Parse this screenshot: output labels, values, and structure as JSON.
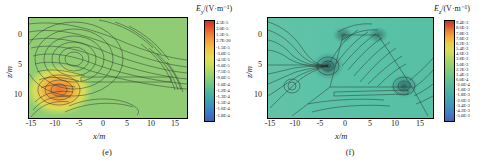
{
  "figure": {
    "panels": [
      {
        "id": "e",
        "caption": "(e)",
        "xlabel": "x/m",
        "ylabel": "z/m",
        "xticks": [
          "-15",
          "-10",
          "-5",
          "0",
          "5",
          "10",
          "15"
        ],
        "yticks": [
          "0",
          "5",
          "10"
        ],
        "colorbar": {
          "title_symbol": "E",
          "title_sub": "y",
          "title_unit": "/(V·m⁻¹)",
          "ticks": [
            "4.5E-5",
            "3.0E-5",
            "1.5E-5",
            "2.7E-20",
            "-1.5E-5",
            "-3.0E-5",
            "-4.5E-5",
            "-6.0E-5",
            "-7.5E-5",
            "-9.0E-5",
            "-1.0E-4",
            "-1.2E-4",
            "-1.3E-4",
            "-1.5E-4",
            "-1.6E-4",
            "-1.8E-4"
          ]
        }
      },
      {
        "id": "f",
        "caption": "(f)",
        "xlabel": "x/m",
        "ylabel": "z/m",
        "xticks": [
          "-15",
          "-10",
          "-5",
          "0",
          "5",
          "10",
          "15"
        ],
        "yticks": [
          "0",
          "5",
          "10"
        ],
        "colorbar": {
          "title_symbol": "E",
          "title_sub": "z",
          "title_unit": "/(V·m⁻¹)",
          "ticks": [
            "9.4E-3",
            "8.6E-3",
            "7.8E-3",
            "7.0E-3",
            "6.2E-3",
            "5.4E-3",
            "4.6E-3",
            "3.8E-3",
            "3.0E-3",
            "2.2E-3",
            "1.4E-3",
            "6.0E-4",
            "-2.0E-4",
            "-1.0E-3",
            "-1.8E-3",
            "-2.6E-3",
            "-3.4E-3",
            "-4.2E-3",
            "-5.0E-3"
          ]
        }
      }
    ]
  },
  "chart_data": [
    {
      "type": "heatmap",
      "panel": "e",
      "title": "Ey/(V·m⁻¹)",
      "xlabel": "x/m",
      "ylabel": "z/m",
      "xlim": [
        -17,
        17
      ],
      "ylim": [
        13,
        -2
      ],
      "xticks": [
        -15,
        -10,
        -5,
        0,
        5,
        10,
        15
      ],
      "yticks": [
        0,
        5,
        10
      ],
      "colormap": "jet",
      "zlim": [
        -0.00018,
        4.5e-05
      ],
      "colorbar_values": [
        4.5e-05,
        3e-05,
        1.5e-05,
        2.7e-20,
        -1.5e-05,
        -3e-05,
        -4.5e-05,
        -6e-05,
        -7.5e-05,
        -9e-05,
        -0.0001,
        -0.00012,
        -0.00013,
        -0.00015,
        -0.00016,
        -0.00018
      ],
      "grid": false,
      "features": [
        {
          "kind": "hot-spot",
          "x": -15.5,
          "z": 10.2,
          "color": "#e8743a",
          "note": "positive field maximum lower-left"
        },
        {
          "kind": "cold-spot",
          "x": -10.5,
          "z": 5.2,
          "color": "#3d78a0",
          "note": "negative field minimum"
        },
        {
          "kind": "conductor",
          "shape": "horizontal-bar",
          "x_start": -8.5,
          "x_end": 12.5,
          "z": 8.3
        }
      ]
    },
    {
      "type": "heatmap",
      "panel": "f",
      "title": "Ez/(V·m⁻¹)",
      "xlabel": "x/m",
      "ylabel": "z/m",
      "xlim": [
        -17,
        16
      ],
      "ylim": [
        13,
        -2
      ],
      "xticks": [
        -15,
        -10,
        -5,
        0,
        5,
        10,
        15
      ],
      "yticks": [
        0,
        5,
        10
      ],
      "colormap": "jet",
      "zlim": [
        -0.005,
        0.0094
      ],
      "colorbar_values": [
        0.0094,
        0.0086,
        0.0078,
        0.007,
        0.0062,
        0.0054,
        0.0046,
        0.0038,
        0.003,
        0.0022,
        0.0014,
        0.0006,
        -0.0002,
        -0.001,
        -0.0018,
        -0.0026,
        -0.0034,
        -0.0042,
        -0.005
      ],
      "grid": false,
      "features": [
        {
          "kind": "conductor",
          "shape": "trapezoid",
          "vertices": [
            [
              -4.6,
              0
            ],
            [
              2.0,
              0
            ],
            [
              11.0,
              8.6
            ],
            [
              -12.4,
              8.6
            ]
          ]
        },
        {
          "kind": "conductor",
          "shape": "horizontal-bar",
          "x_start": -17,
          "x_end": -8.6,
          "z": 4.6
        },
        {
          "kind": "conductor",
          "shape": "horizontal-bar",
          "x_start": -7.5,
          "x_end": 10.5,
          "z": 8.8
        },
        {
          "kind": "conductor",
          "shape": "leg",
          "from": [
            -12.4,
            8.6
          ],
          "to": [
            -16.0,
            12.6
          ]
        },
        {
          "kind": "conductor",
          "shape": "leg",
          "from": [
            11.0,
            8.6
          ],
          "to": [
            14.6,
            12.6
          ]
        },
        {
          "kind": "singularity",
          "x": -8.6,
          "z": 4.6
        },
        {
          "kind": "singularity",
          "x": 11.0,
          "z": 8.6
        }
      ]
    }
  ]
}
